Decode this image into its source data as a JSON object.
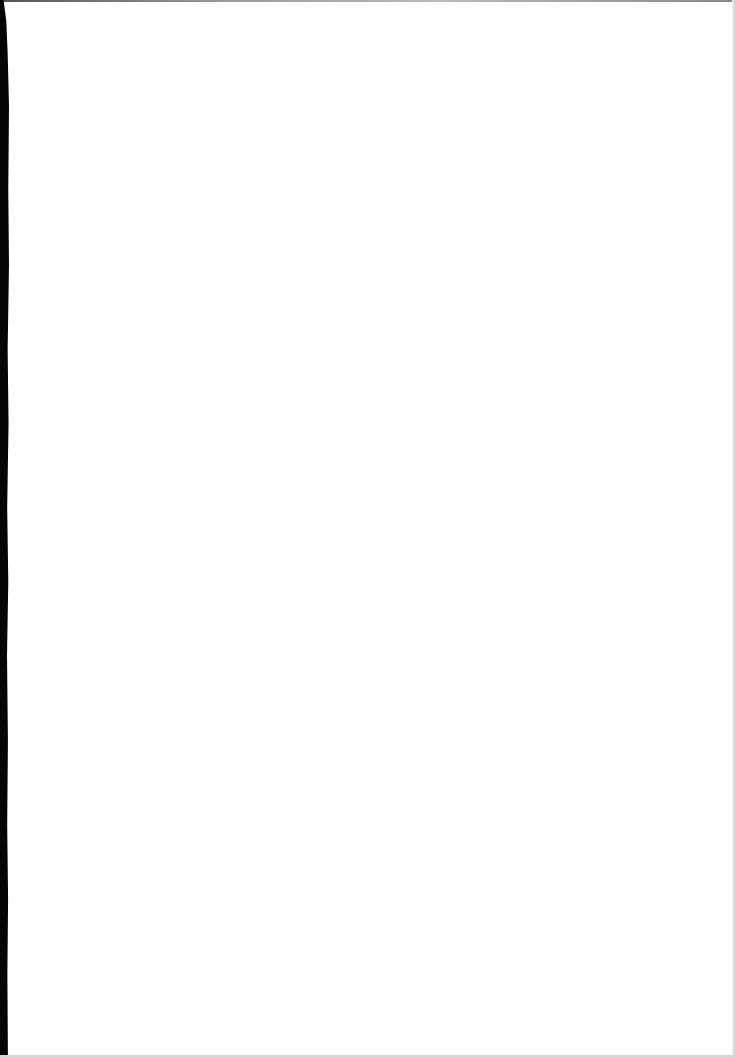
{
  "page": {
    "type": "scanned-blank-page",
    "text": "",
    "colors": {
      "paper": "#ffffff",
      "binding_shadow": "#050505",
      "edge": "#cfcfcf"
    }
  }
}
